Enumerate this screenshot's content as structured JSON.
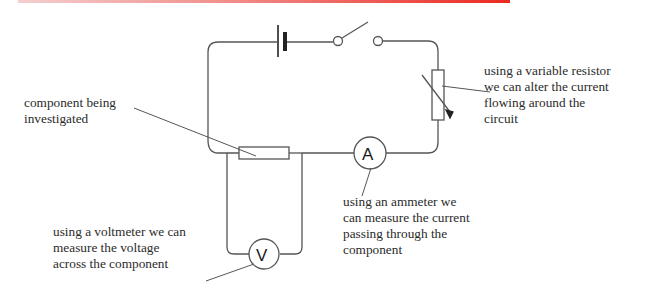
{
  "header_bar": {
    "color_start": "#f4cfcf",
    "color_end": "#ea2a22"
  },
  "circuit": {
    "components": [
      "cell",
      "switch",
      "variable-resistor",
      "ammeter",
      "resistor",
      "voltmeter"
    ],
    "ammeter_symbol": "A",
    "voltmeter_symbol": "V",
    "wire_color": "#555555"
  },
  "labels": {
    "variable_resistor": "using a variable resistor\nwe can alter the current\nflowing around the\ncircuit",
    "component": "component being\ninvestigated",
    "ammeter": "using an ammeter we\ncan measure the current\npassing through the\ncomponent",
    "voltmeter": "using a voltmeter we can\nmeasure the voltage\nacross the component"
  }
}
